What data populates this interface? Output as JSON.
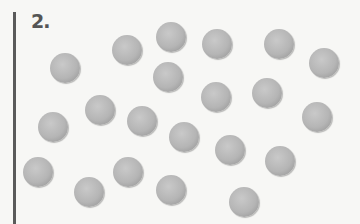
{
  "question": {
    "number": "2."
  },
  "ball_color": "#b8b8b8",
  "balls": [
    {
      "x": 65,
      "y": 68
    },
    {
      "x": 127,
      "y": 50
    },
    {
      "x": 171,
      "y": 37
    },
    {
      "x": 217,
      "y": 44
    },
    {
      "x": 279,
      "y": 44
    },
    {
      "x": 324,
      "y": 63
    },
    {
      "x": 168,
      "y": 77
    },
    {
      "x": 216,
      "y": 97
    },
    {
      "x": 267,
      "y": 93
    },
    {
      "x": 100,
      "y": 110
    },
    {
      "x": 53,
      "y": 127
    },
    {
      "x": 142,
      "y": 121
    },
    {
      "x": 184,
      "y": 137
    },
    {
      "x": 317,
      "y": 117
    },
    {
      "x": 230,
      "y": 150
    },
    {
      "x": 280,
      "y": 161
    },
    {
      "x": 38,
      "y": 172
    },
    {
      "x": 128,
      "y": 172
    },
    {
      "x": 89,
      "y": 192
    },
    {
      "x": 171,
      "y": 190
    },
    {
      "x": 244,
      "y": 202
    }
  ],
  "count": 21
}
